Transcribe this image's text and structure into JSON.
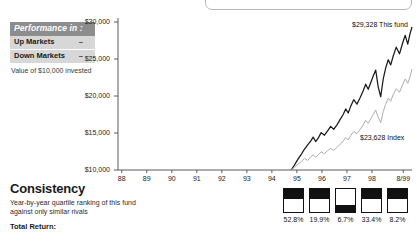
{
  "legend": {
    "header": "Performance in :",
    "rows": [
      {
        "label": "Up Markets",
        "value": "–"
      },
      {
        "label": "Down Markets",
        "value": "–"
      }
    ],
    "caption": "Value of $10,000 invested"
  },
  "consistency": {
    "title": "Consistency",
    "subtitle": "Year-by-year quartile ranking of this fund against only similar rivals",
    "total_return_label": "Total Return:"
  },
  "annotations": {
    "fund": "$29,328 This fund",
    "index": "$23,628 Index"
  },
  "quartile": {
    "percents": [
      "52.8%",
      "19.9%",
      "6.7%",
      "33.4%",
      "8.2%"
    ]
  },
  "chart_data": {
    "type": "line",
    "title": "",
    "xlabel": "",
    "ylabel": "",
    "ylim": [
      10000,
      30000
    ],
    "yticks": [
      10000,
      15000,
      20000,
      25000,
      30000
    ],
    "ytick_labels": [
      "$10,000",
      "$15,000",
      "$20,000",
      "$25,000",
      "$30,000"
    ],
    "x": [
      "88",
      "89",
      "90",
      "91",
      "92",
      "93",
      "94",
      "95",
      "96",
      "97",
      "98",
      "8/99"
    ],
    "xtick_labels": [
      "88",
      "89",
      "90",
      "91",
      "92",
      "93",
      "94",
      "95",
      "96",
      "97",
      "98",
      "8/99"
    ],
    "grid": false,
    "legend_position": "inline-annotation",
    "series": [
      {
        "name": "This fund",
        "color": "#1a1a1a",
        "end_value": 29328,
        "points": [
          [
            1994.92,
            10000
          ],
          [
            1995.05,
            10650
          ],
          [
            1995.2,
            11500
          ],
          [
            1995.33,
            12150
          ],
          [
            1995.45,
            12800
          ],
          [
            1995.58,
            13400
          ],
          [
            1995.7,
            13900
          ],
          [
            1995.8,
            14450
          ],
          [
            1995.9,
            13850
          ],
          [
            1996.0,
            14300
          ],
          [
            1996.12,
            15050
          ],
          [
            1996.25,
            14700
          ],
          [
            1996.37,
            15250
          ],
          [
            1996.5,
            15900
          ],
          [
            1996.62,
            15500
          ],
          [
            1996.75,
            16100
          ],
          [
            1996.88,
            16850
          ],
          [
            1997.0,
            17500
          ],
          [
            1997.1,
            18250
          ],
          [
            1997.2,
            17700
          ],
          [
            1997.3,
            18600
          ],
          [
            1997.42,
            19500
          ],
          [
            1997.55,
            18900
          ],
          [
            1997.68,
            19800
          ],
          [
            1997.8,
            20700
          ],
          [
            1997.9,
            21600
          ],
          [
            1998.0,
            20900
          ],
          [
            1998.1,
            21800
          ],
          [
            1998.2,
            22700
          ],
          [
            1998.3,
            23500
          ],
          [
            1998.4,
            21200
          ],
          [
            1998.5,
            19900
          ],
          [
            1998.6,
            22300
          ],
          [
            1998.7,
            23800
          ],
          [
            1998.8,
            24900
          ],
          [
            1998.9,
            24200
          ],
          [
            1999.0,
            25400
          ],
          [
            1999.12,
            26600
          ],
          [
            1999.25,
            25700
          ],
          [
            1999.37,
            27100
          ],
          [
            1999.48,
            28200
          ],
          [
            1999.58,
            27000
          ],
          [
            1999.67,
            28400
          ],
          [
            1999.75,
            29328
          ]
        ]
      },
      {
        "name": "Index",
        "color": "#adadad",
        "end_value": 23628,
        "points": [
          [
            1994.92,
            10000
          ],
          [
            1995.05,
            10350
          ],
          [
            1995.2,
            10800
          ],
          [
            1995.33,
            11150
          ],
          [
            1995.45,
            11550
          ],
          [
            1995.58,
            11300
          ],
          [
            1995.7,
            11750
          ],
          [
            1995.8,
            12050
          ],
          [
            1995.9,
            11700
          ],
          [
            1996.0,
            12050
          ],
          [
            1996.12,
            12450
          ],
          [
            1996.25,
            12200
          ],
          [
            1996.37,
            12600
          ],
          [
            1996.5,
            12900
          ],
          [
            1996.62,
            12650
          ],
          [
            1996.75,
            13050
          ],
          [
            1996.88,
            13500
          ],
          [
            1997.0,
            13900
          ],
          [
            1997.1,
            14400
          ],
          [
            1997.2,
            14050
          ],
          [
            1997.3,
            14650
          ],
          [
            1997.42,
            15200
          ],
          [
            1997.55,
            14900
          ],
          [
            1997.68,
            15500
          ],
          [
            1997.8,
            16100
          ],
          [
            1997.9,
            16700
          ],
          [
            1998.0,
            16300
          ],
          [
            1998.1,
            16900
          ],
          [
            1998.2,
            17500
          ],
          [
            1998.3,
            18100
          ],
          [
            1998.4,
            17100
          ],
          [
            1998.5,
            16400
          ],
          [
            1998.6,
            17900
          ],
          [
            1998.7,
            18900
          ],
          [
            1998.8,
            19700
          ],
          [
            1998.9,
            19300
          ],
          [
            1999.0,
            20200
          ],
          [
            1999.12,
            21000
          ],
          [
            1999.25,
            20500
          ],
          [
            1999.37,
            21500
          ],
          [
            1999.48,
            22300
          ],
          [
            1999.58,
            21700
          ],
          [
            1999.67,
            22600
          ],
          [
            1999.75,
            23628
          ]
        ]
      }
    ],
    "quartile_bars": {
      "labels": [
        "52.8%",
        "19.9%",
        "6.7%",
        "33.4%",
        "8.2%"
      ],
      "fill_position": [
        "top",
        "top",
        "bottom",
        "top",
        "top"
      ],
      "fill_fraction": [
        0.45,
        0.45,
        0.3,
        0.45,
        0.45
      ]
    }
  }
}
